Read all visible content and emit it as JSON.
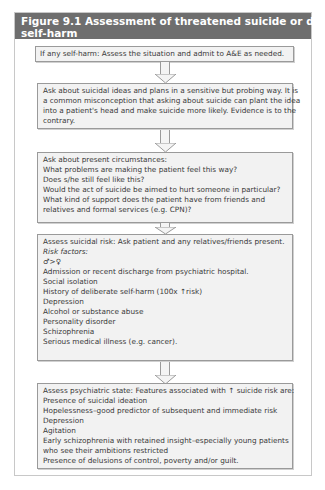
{
  "figure": {
    "title_line1": "Figure 9.1  Assessment of threatened suicide or deliberate",
    "title_line2": "self-harm",
    "header_color": "#6e6e6e"
  },
  "boxes": [
    {
      "lines": [
        "If any self-harm: Assess the situation and admit to A&E as needed."
      ]
    },
    {
      "lines": [
        "Ask about suicidal ideas and plans in a sensitive but probing way. It is",
        "a common misconception that asking about suicide can plant the idea",
        "into a patient's head and make suicide more likely. Evidence is to the",
        "contrary."
      ]
    },
    {
      "lines": [
        "Ask about present circumstances:",
        "What problems are making the patient feel this way?",
        "Does s/he still feel like this?",
        "Would the act of suicide be aimed to hurt someone in particular?",
        "What kind of support does the patient have from friends and",
        "relatives and formal services (e.g. CPN)?"
      ]
    },
    {
      "heading": "Assess suicidal risk: Ask patient and any relatives/friends present.",
      "subheading": "Risk factors:",
      "lines": [
        "♂>♀",
        "Admission or recent discharge from psychiatric hospital.",
        "Social isolation",
        "History of deliberate self-harm (100x ↑risk)",
        "Depression",
        "Alcohol or substance abuse",
        "Personality disorder",
        "Schizophrenia",
        "Serious medical illness (e.g. cancer)."
      ]
    },
    {
      "lines": [
        "Assess psychiatric state: Features associated with ↑ suicide risk are:",
        "Presence of suicidal ideation",
        "Hopelessness–good predictor of subsequent and immediate risk",
        "Depression",
        "Agitation",
        "Early schizophrenia with retained insight–especially young patients",
        "who see their ambitions restricted",
        "Presence of delusions of control, poverty and/or guilt."
      ]
    }
  ]
}
